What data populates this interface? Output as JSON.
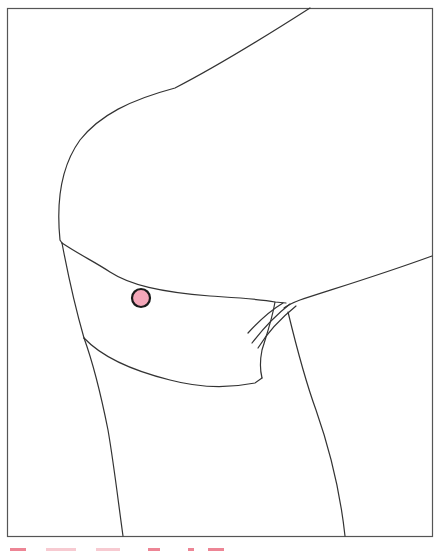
{
  "figure": {
    "point_marker": {
      "label": "acupoint marker",
      "fill": "#f4a7b9",
      "stroke": "#1a1a1a"
    },
    "line_color": "#333333",
    "frame_color": "#555555"
  },
  "caption": {
    "text": "",
    "color": "#e8667a",
    "clipped": true
  }
}
